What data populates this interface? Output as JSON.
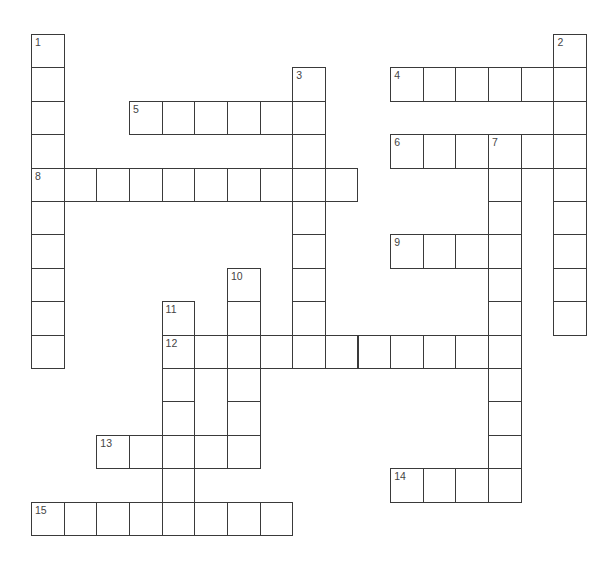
{
  "puzzle": {
    "type": "crossword",
    "grid_origin": {
      "x": 31,
      "y": 34
    },
    "cell_size": {
      "w": 32.65,
      "h": 33.4
    },
    "colors": {
      "line": "#3a3a3a",
      "number": "#444444",
      "background": "#ffffff"
    },
    "entries": [
      {
        "number": "1",
        "direction": "down",
        "row": 0,
        "col": 0,
        "length": 10
      },
      {
        "number": "2",
        "direction": "down",
        "row": 0,
        "col": 16,
        "length": 9
      },
      {
        "number": "3",
        "direction": "down",
        "row": 1,
        "col": 8,
        "length": 9
      },
      {
        "number": "4",
        "direction": "across",
        "row": 1,
        "col": 11,
        "length": 6
      },
      {
        "number": "5",
        "direction": "across",
        "row": 2,
        "col": 3,
        "length": 6
      },
      {
        "number": "6",
        "direction": "across",
        "row": 3,
        "col": 11,
        "length": 6
      },
      {
        "number": "7",
        "direction": "down",
        "row": 3,
        "col": 14,
        "length": 11
      },
      {
        "number": "8",
        "direction": "across",
        "row": 4,
        "col": 0,
        "length": 10
      },
      {
        "number": "9",
        "direction": "across",
        "row": 6,
        "col": 11,
        "length": 4
      },
      {
        "number": "10",
        "direction": "down",
        "row": 7,
        "col": 6,
        "length": 6
      },
      {
        "number": "11",
        "direction": "down",
        "row": 8,
        "col": 4,
        "length": 7
      },
      {
        "number": "12",
        "direction": "across",
        "row": 9,
        "col": 4,
        "length": 11
      },
      {
        "number": "13",
        "direction": "across",
        "row": 12,
        "col": 2,
        "length": 5
      },
      {
        "number": "14",
        "direction": "across",
        "row": 13,
        "col": 11,
        "length": 4
      },
      {
        "number": "15",
        "direction": "across",
        "row": 14,
        "col": 0,
        "length": 8
      }
    ]
  }
}
